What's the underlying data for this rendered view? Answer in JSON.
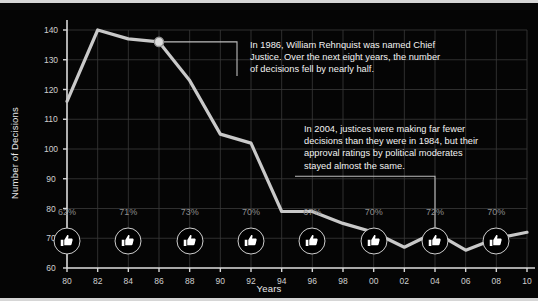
{
  "chart_data": {
    "type": "line",
    "title": "",
    "xlabel": "Years",
    "ylabel": "Number of Decisions",
    "xlim": [
      1980,
      2010
    ],
    "ylim": [
      60,
      140
    ],
    "grid": true,
    "legend": "none",
    "x": [
      1980,
      1982,
      1984,
      1986,
      1988,
      1990,
      1992,
      1994,
      1996,
      1998,
      2000,
      2002,
      2004,
      2006,
      2008,
      2010
    ],
    "xtick_labels": [
      "80",
      "82",
      "84",
      "86",
      "88",
      "90",
      "92",
      "94",
      "96",
      "98",
      "00",
      "02",
      "04",
      "06",
      "08",
      "10"
    ],
    "ytick_labels": [
      "60",
      "70",
      "80",
      "90",
      "100",
      "110",
      "120",
      "130",
      "140"
    ],
    "ytick_values": [
      60,
      70,
      80,
      90,
      100,
      110,
      120,
      130,
      140
    ],
    "series": [
      {
        "name": "Number of Decisions",
        "color": "#c9c9c9",
        "values": [
          116,
          140,
          137,
          136,
          123,
          105,
          102,
          79,
          79,
          75,
          72,
          67,
          72,
          66,
          70,
          72
        ]
      }
    ],
    "markers": [
      {
        "name": "marker-1986",
        "x": 1986,
        "y": 136
      },
      {
        "name": "marker-2004",
        "x": 2004,
        "y": 72
      }
    ],
    "annotations": [
      {
        "name": "annotation-1986",
        "text": "In 1986, William Rehnquist was named Chief\nJustice. Over the next eight years, the number\nof decisions fell by nearly half."
      },
      {
        "name": "annotation-2004",
        "text": "In 2004, justices were making far fewer\ndecisions than they were in 1984, but their\napproval ratings by political moderates\nstayed almost the same."
      }
    ],
    "approval_ratings": {
      "icon": "thumbs-up-icon",
      "points": [
        {
          "x": 1980,
          "label": "62%",
          "value": 62
        },
        {
          "x": 1984,
          "label": "71%",
          "value": 71
        },
        {
          "x": 1988,
          "label": "73%",
          "value": 73
        },
        {
          "x": 1992,
          "label": "70%",
          "value": 70
        },
        {
          "x": 1996,
          "label": "67%",
          "value": 67
        },
        {
          "x": 2000,
          "label": "70%",
          "value": 70
        },
        {
          "x": 2004,
          "label": "72%",
          "value": 72
        },
        {
          "x": 2008,
          "label": "70%",
          "value": 70
        }
      ]
    },
    "colors": {
      "background": "#050505",
      "line": "#c9c9c9",
      "grid": "#3a3a3a",
      "axis": "#d8d8d8",
      "text": "#f2f2f2",
      "muted_text": "#8e8e8e",
      "border": "#d6d6d6"
    }
  }
}
